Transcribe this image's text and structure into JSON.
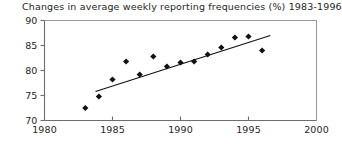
{
  "chart_data": {
    "type": "scatter",
    "title": "Changes in average weekly reporting frequencies (%) 1983-1996",
    "xlabel": "",
    "ylabel": "",
    "xlim": [
      1980,
      2000
    ],
    "ylim": [
      70,
      90
    ],
    "grid": false,
    "legend": null,
    "x_ticks": [
      1980,
      1985,
      1990,
      1995,
      2000
    ],
    "y_ticks": [
      70,
      75,
      80,
      85,
      90
    ],
    "x_tick_labels": [
      "1980",
      "1985",
      "1990",
      "1995",
      "2000"
    ],
    "y_tick_labels": [
      "70",
      "75",
      "80",
      "85",
      "90"
    ],
    "marker": "diamond",
    "marker_color": "#111111",
    "x": [
      1983,
      1984,
      1985,
      1986,
      1987,
      1988,
      1989,
      1990,
      1991,
      1992,
      1993,
      1994,
      1995,
      1996
    ],
    "values": [
      72.5,
      74.8,
      78.2,
      81.8,
      79.2,
      82.8,
      80.8,
      81.6,
      81.8,
      83.2,
      84.6,
      86.6,
      86.8,
      84.0
    ],
    "points": [
      {
        "x": 1983,
        "y": 72.5
      },
      {
        "x": 1984,
        "y": 74.8
      },
      {
        "x": 1985,
        "y": 78.2
      },
      {
        "x": 1986,
        "y": 81.8
      },
      {
        "x": 1987,
        "y": 79.2
      },
      {
        "x": 1988,
        "y": 82.8
      },
      {
        "x": 1989,
        "y": 80.8
      },
      {
        "x": 1990,
        "y": 81.6
      },
      {
        "x": 1991,
        "y": 81.8
      },
      {
        "x": 1992,
        "y": 83.2
      },
      {
        "x": 1993,
        "y": 84.6
      },
      {
        "x": 1994,
        "y": 86.6
      },
      {
        "x": 1995,
        "y": 86.8
      },
      {
        "x": 1996,
        "y": 84.0
      }
    ],
    "trendline": {
      "type": "linear",
      "x_start": 1983.75,
      "y_start": 75.8,
      "x_end": 1996.6,
      "y_end": 87.0,
      "color": "#111111"
    }
  }
}
